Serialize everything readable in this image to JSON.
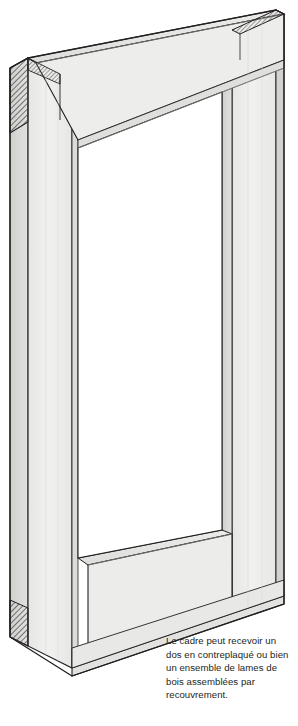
{
  "figure": {
    "colors": {
      "outline": "#231f20",
      "front_face": "#ececeb",
      "front_face_light": "#f2f2f1",
      "top_face": "#e4e4e2",
      "side_face": "#d9d9d7",
      "side_face_dark": "#c9c9c6",
      "inner_shadow": "#dcdcda",
      "hatch": "#4a4a4a",
      "background": "#ffffff",
      "caption_text": "#231f20"
    },
    "parts": [
      {
        "name": "top-rail",
        "label": "traverse haute"
      },
      {
        "name": "bottom-rail",
        "label": "traverse basse"
      },
      {
        "name": "left-stile",
        "label": "montant gauche"
      },
      {
        "name": "right-stile",
        "label": "montant droit"
      },
      {
        "name": "inner-opening",
        "label": "ouverture interieure"
      }
    ],
    "joints": [
      {
        "name": "top-left-joint",
        "hatched": true
      },
      {
        "name": "top-right-joint",
        "hatched": true
      },
      {
        "name": "bottom-left-joint",
        "hatched": true
      }
    ]
  },
  "caption": {
    "text": "Le cadre peut recevoir un dos en contreplaqué ou bien un ensemble de lames de bois assemblées par recouvrement.",
    "lines": [
      "Le cadre peut recevoir un",
      "dos en contreplaqué ou",
      "bien un ensemble de lames",
      "de bois assemblées par",
      "recouvrement."
    ]
  }
}
